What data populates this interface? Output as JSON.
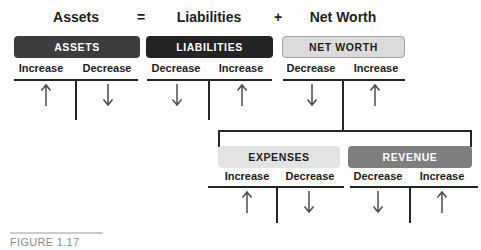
{
  "equation": {
    "assets": "Assets",
    "equals_sign": "=",
    "liabilities": "Liabilities",
    "plus_sign": "+",
    "net_worth": "Net Worth"
  },
  "accounts": {
    "assets": {
      "header": "ASSETS",
      "left_label": "Increase",
      "right_label": "Decrease",
      "left_arrow": "up",
      "right_arrow": "down",
      "header_bg": "#3d3d3d",
      "header_text_color": "#ffffff"
    },
    "liabilities": {
      "header": "LIABILITIES",
      "left_label": "Decrease",
      "right_label": "Increase",
      "left_arrow": "down",
      "right_arrow": "up",
      "header_bg": "#242424",
      "header_text_color": "#ffffff"
    },
    "net_worth": {
      "header": "NET WORTH",
      "left_label": "Decrease",
      "right_label": "Increase",
      "left_arrow": "down",
      "right_arrow": "up",
      "header_bg": "#dbdbdb",
      "header_text_color": "#1f1f1f"
    },
    "expenses": {
      "header": "EXPENSES",
      "left_label": "Increase",
      "right_label": "Decrease",
      "left_arrow": "up",
      "right_arrow": "down",
      "header_bg": "#e3e3e3",
      "header_text_color": "#1f1f1f"
    },
    "revenue": {
      "header": "REVENUE",
      "left_label": "Decrease",
      "right_label": "Increase",
      "left_arrow": "down",
      "right_arrow": "up",
      "header_bg": "#7e7e7e",
      "header_text_color": "#ffffff"
    }
  },
  "caption": "FIGURE 1.17",
  "colors": {
    "line": "#262626",
    "arrow": "#4d4d4d",
    "equation_text": "#1f1f1f",
    "caption_text": "#8e8e8e",
    "caption_rule": "#cccccc",
    "background": "#ffffff"
  }
}
